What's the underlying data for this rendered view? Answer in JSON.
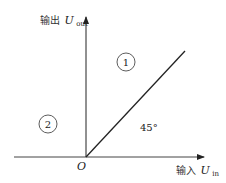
{
  "diagram": {
    "y_axis": {
      "label_prefix": "输出",
      "label_var": "U",
      "label_sub": "out"
    },
    "x_axis": {
      "label_prefix": "输入",
      "label_var": "U",
      "label_sub": "in"
    },
    "origin_label": "O",
    "angle_label": "45°",
    "regions": [
      {
        "id": "1",
        "label": "1"
      },
      {
        "id": "2",
        "label": "2"
      }
    ],
    "colors": {
      "line": "#222222",
      "background": "#ffffff"
    }
  }
}
